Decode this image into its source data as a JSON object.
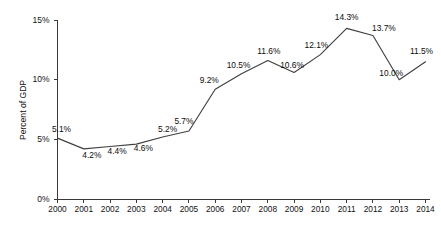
{
  "chart_data": {
    "type": "line",
    "title": "",
    "xlabel": "",
    "ylabel": "Percent of GDP",
    "ylim": [
      0,
      15
    ],
    "ytick_labels": [
      "0%",
      "5%",
      "10%",
      "15%"
    ],
    "ytick_values": [
      0,
      5,
      10,
      15
    ],
    "grid": false,
    "legend": null,
    "categories": [
      "2000",
      "2001",
      "2002",
      "2003",
      "2004",
      "2005",
      "2006",
      "2007",
      "2008",
      "2009",
      "2010",
      "2011",
      "2012",
      "2013",
      "2014"
    ],
    "values": [
      5.1,
      4.2,
      4.4,
      4.6,
      5.2,
      5.7,
      9.2,
      10.5,
      11.6,
      10.6,
      12.1,
      14.3,
      13.7,
      10.0,
      11.5
    ],
    "data_labels": [
      "5.1%",
      "4.2%",
      "4.4%",
      "4.6%",
      "5.2%",
      "5.7%",
      "9.2%",
      "10.5%",
      "11.6%",
      "10.6%",
      "12.1%",
      "14.3%",
      "13.7%",
      "10.0%",
      "11.5%"
    ],
    "series": [
      {
        "name": "Percent of GDP",
        "color": "#404040",
        "values": [
          5.1,
          4.2,
          4.4,
          4.6,
          5.2,
          5.7,
          9.2,
          10.5,
          11.6,
          10.6,
          12.1,
          14.3,
          13.7,
          10.0,
          11.5
        ]
      }
    ],
    "label_offsets": [
      {
        "dx": 4,
        "dy": -6
      },
      {
        "dx": 8,
        "dy": 9
      },
      {
        "dx": 7,
        "dy": 8
      },
      {
        "dx": 7,
        "dy": 7
      },
      {
        "dx": 5,
        "dy": -5
      },
      {
        "dx": -5,
        "dy": -7
      },
      {
        "dx": -6,
        "dy": -6
      },
      {
        "dx": -3,
        "dy": -6
      },
      {
        "dx": 1,
        "dy": -7
      },
      {
        "dx": -2,
        "dy": -5
      },
      {
        "dx": -4,
        "dy": -7
      },
      {
        "dx": 0,
        "dy": -8
      },
      {
        "dx": 11,
        "dy": -5
      },
      {
        "dx": -8,
        "dy": -4
      },
      {
        "dx": -4,
        "dy": -8
      }
    ]
  },
  "axis_colors": {
    "axis": "#3a3a3a",
    "line": "#404040",
    "text": "#111111",
    "background": "#ffffff"
  }
}
